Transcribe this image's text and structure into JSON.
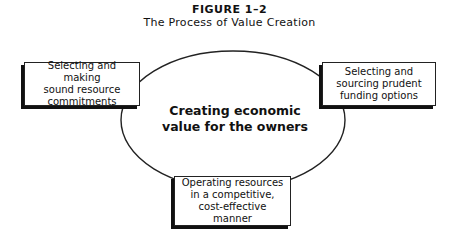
{
  "figure": {
    "label": "FIGURE 1–2",
    "title": "The Process of Value Creation"
  },
  "center": {
    "line1": "Creating economic",
    "line2": "value for the owners"
  },
  "nodes": {
    "left": {
      "lines": [
        "Selecting and making",
        "sound resource",
        "commitments"
      ]
    },
    "right": {
      "lines": [
        "Selecting and",
        "sourcing prudent",
        "funding options"
      ]
    },
    "bottom": {
      "lines": [
        "Operating resources",
        "in a competitive,",
        "cost-effective manner"
      ]
    }
  },
  "colors": {
    "line": "#222222",
    "shadow": "#111111",
    "background": "#ffffff"
  }
}
